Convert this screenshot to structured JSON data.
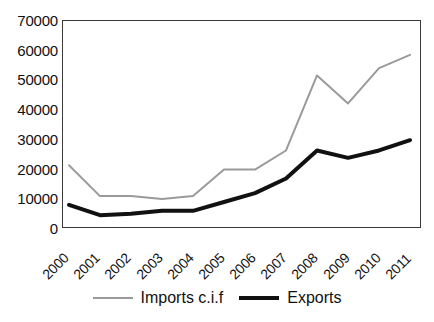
{
  "chart_data": {
    "type": "line",
    "title": "",
    "xlabel": "",
    "ylabel": "",
    "categories": [
      "2000",
      "2001",
      "2002",
      "2003",
      "2004",
      "2005",
      "2006",
      "2007",
      "2008",
      "2009",
      "2010",
      "2011"
    ],
    "series": [
      {
        "name": "Imports c.i.f",
        "color": "#9a9a9a",
        "values": [
          21000,
          10500,
          10500,
          9500,
          10500,
          19500,
          19500,
          26000,
          51500,
          42000,
          54000,
          58500
        ]
      },
      {
        "name": "Exports",
        "color": "#111111",
        "values": [
          7500,
          4000,
          4500,
          5500,
          5500,
          8500,
          11500,
          16500,
          26000,
          23500,
          26000,
          29500
        ]
      }
    ],
    "ylim": [
      0,
      70000
    ],
    "ytick_labels": [
      "70000",
      "60000",
      "50000",
      "40000",
      "30000",
      "20000",
      "10000",
      "0"
    ],
    "ytick_values": [
      70000,
      60000,
      50000,
      40000,
      30000,
      20000,
      10000,
      0
    ],
    "grid": false,
    "legend_position": "bottom"
  },
  "legend": {
    "entries": [
      {
        "label": "Imports c.i.f"
      },
      {
        "label": "Exports"
      }
    ]
  }
}
